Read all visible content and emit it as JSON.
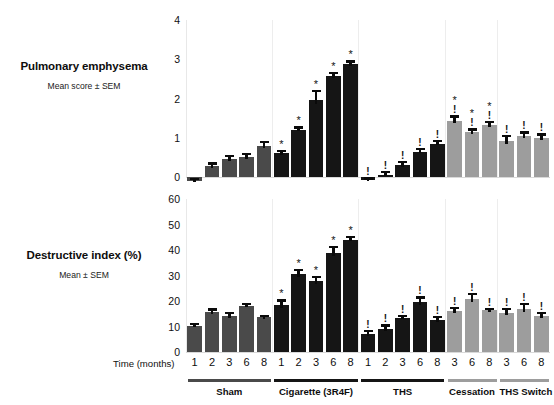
{
  "figure": {
    "x_axis_caption": "Time (months)",
    "panels": [
      {
        "id": "pulmonary-emphysema",
        "title": "Pulmonary emphysema",
        "subtitle": "Mean score ± SEM"
      },
      {
        "id": "destructive-index",
        "title": "Destructive index (%)",
        "subtitle": "Mean ± SEM"
      }
    ],
    "groups": [
      {
        "name": "Sham",
        "color": "#4a4a4a",
        "rule_color": "#4a4a4a",
        "timepoints": [
          "1",
          "2",
          "3",
          "6",
          "8"
        ]
      },
      {
        "name": "Cigarette (3R4F)",
        "color": "#151515",
        "rule_color": "#151515",
        "timepoints": [
          "1",
          "2",
          "3",
          "6",
          "8"
        ]
      },
      {
        "name": "THS",
        "color": "#151515",
        "rule_color": "#151515",
        "timepoints": [
          "1",
          "2",
          "3",
          "6",
          "8"
        ]
      },
      {
        "name": "Cessation",
        "color": "#9d9d9d",
        "rule_color": "#9d9d9d",
        "timepoints": [
          "3",
          "6",
          "8"
        ]
      },
      {
        "name": "THS Switch",
        "color": "#9d9d9d",
        "rule_color": "#9d9d9d",
        "timepoints": [
          "3",
          "6",
          "8"
        ]
      }
    ]
  },
  "chart_data": [
    {
      "type": "bar",
      "id": "pulmonary-emphysema",
      "title": "Pulmonary emphysema",
      "subtitle": "Mean score ± SEM",
      "xlabel": "Time (months)",
      "ylabel": "Mean score ± SEM",
      "ylim": [
        0,
        4
      ],
      "yticks": [
        "0",
        "1",
        "2",
        "3",
        "4"
      ],
      "ytick_values": [
        0,
        1,
        2,
        3,
        4
      ],
      "grid": false,
      "legend": "none",
      "categories": [
        "Sham 1",
        "Sham 2",
        "Sham 3",
        "Sham 6",
        "Sham 8",
        "Cigarette (3R4F) 1",
        "Cigarette (3R4F) 2",
        "Cigarette (3R4F) 3",
        "Cigarette (3R4F) 6",
        "Cigarette (3R4F) 8",
        "THS 1",
        "THS 2",
        "THS 3",
        "THS 6",
        "THS 8",
        "Cessation 3",
        "Cessation 6",
        "Cessation 8",
        "THS Switch 3",
        "THS Switch 6",
        "THS Switch 8"
      ],
      "values": [
        -0.1,
        0.27,
        0.46,
        0.5,
        0.79,
        0.61,
        1.2,
        1.97,
        2.57,
        2.88,
        -0.08,
        0.06,
        0.31,
        0.65,
        0.85,
        1.43,
        1.14,
        1.32,
        0.91,
        1.05,
        0.99
      ],
      "errors": [
        0.07,
        0.1,
        0.1,
        0.12,
        0.13,
        0.09,
        0.09,
        0.24,
        0.11,
        0.09,
        0.07,
        0.09,
        0.1,
        0.1,
        0.1,
        0.14,
        0.1,
        0.1,
        0.17,
        0.11,
        0.12
      ],
      "annotations": [
        "",
        "",
        "",
        "",
        "",
        "*",
        "*",
        "*",
        "*",
        "*",
        "!",
        "!",
        "!",
        "!",
        "!",
        "*!",
        "*!",
        "*!",
        "!",
        "!",
        "!"
      ]
    },
    {
      "type": "bar",
      "id": "destructive-index",
      "title": "Destructive index (%)",
      "subtitle": "Mean ± SEM",
      "xlabel": "Time (months)",
      "ylabel": "Mean ± SEM",
      "ylim": [
        0,
        60
      ],
      "yticks": [
        "0",
        "10",
        "20",
        "30",
        "40",
        "50",
        "60"
      ],
      "ytick_values": [
        0,
        10,
        20,
        30,
        40,
        50,
        60
      ],
      "grid": false,
      "legend": "none",
      "categories": [
        "Sham 1",
        "Sham 2",
        "Sham 3",
        "Sham 6",
        "Sham 8",
        "Cigarette (3R4F) 1",
        "Cigarette (3R4F) 2",
        "Cigarette (3R4F) 3",
        "Cigarette (3R4F) 6",
        "Cigarette (3R4F) 8",
        "THS 1",
        "THS 2",
        "THS 3",
        "THS 6",
        "THS 8",
        "Cessation 3",
        "Cessation 6",
        "Cessation 8",
        "THS Switch 3",
        "THS Switch 6",
        "THS Switch 8"
      ],
      "values": [
        10.3,
        15.5,
        14.0,
        18.0,
        13.7,
        18.4,
        30.5,
        27.7,
        39.0,
        44.0,
        7.0,
        9.0,
        13.4,
        19.5,
        12.5,
        16.0,
        20.8,
        16.3,
        15.4,
        16.8,
        14.0
      ],
      "errors": [
        1.1,
        1.6,
        1.7,
        1.2,
        0.9,
        2.2,
        2.0,
        2.2,
        2.6,
        1.4,
        1.6,
        1.8,
        1.3,
        2.3,
        1.7,
        1.6,
        2.3,
        1.1,
        1.8,
        2.3,
        1.6
      ],
      "annotations": [
        "",
        "",
        "",
        "",
        "",
        "*",
        "*",
        "*",
        "*",
        "*",
        "!",
        "!",
        "!",
        "!",
        "!",
        "!",
        "!",
        "!",
        "!",
        "!",
        "!"
      ]
    }
  ]
}
